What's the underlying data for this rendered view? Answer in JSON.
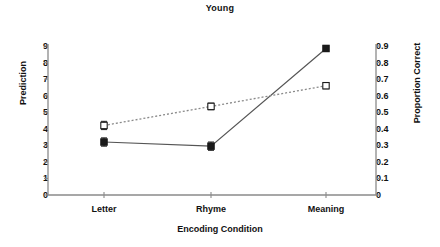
{
  "chart_data": {
    "type": "line",
    "title": "Young",
    "xlabel": "Encoding Condition",
    "ylabel": "Prediction",
    "y2label": "Proportion Correct",
    "categories": [
      "Letter",
      "Rhyme",
      "Meaning"
    ],
    "ylim": [
      0,
      9
    ],
    "y2lim": [
      0,
      0.9
    ],
    "yticks": [
      "9",
      "8",
      "7",
      "6",
      "5",
      "4",
      "3",
      "2",
      "1",
      "0"
    ],
    "y2ticks": [
      "0.9",
      "0.8",
      "0.7",
      "0.6",
      "0.5",
      "0.4",
      "0.3",
      "0.2",
      "0.1",
      "0"
    ],
    "grid": false,
    "legend": "none",
    "series": [
      {
        "name": "Prediction",
        "axis": "left",
        "marker": "filled-square",
        "line": "solid",
        "color": "#000000",
        "values": [
          3.2,
          2.95,
          8.85
        ],
        "errors": [
          0.25,
          0.25,
          0.12
        ]
      },
      {
        "name": "Proportion Correct",
        "axis": "right",
        "marker": "open-square",
        "line": "dotted",
        "color": "#000000",
        "values": [
          0.39,
          0.5,
          0.62
        ],
        "values_on_left_scale": [
          4.2,
          5.35,
          6.6
        ],
        "errors": [
          0.25,
          0.2,
          0.12
        ]
      }
    ]
  }
}
